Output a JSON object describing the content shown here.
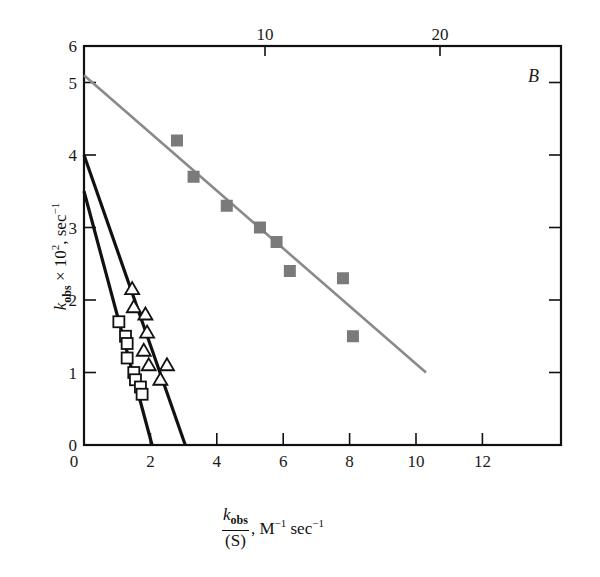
{
  "chart_data": {
    "type": "scatter",
    "title": "",
    "panel_label": "B",
    "xlabel": "k_obs/(S), M^-1 sec^-1",
    "xlabel_parts": {
      "num": "k",
      "num_sub": "obs",
      "den": "(S)",
      "rest": ", M",
      "rest_sup1": "−1",
      "rest2": " sec",
      "rest_sup2": "−1"
    },
    "ylabel": "k_obs × 10^2, sec^-1",
    "ylabel_parts": {
      "main": "k",
      "sub": "obs",
      "mid": " × 10",
      "sup": "2",
      "tail": ", sec",
      "sup2": "−1"
    },
    "xlim": [
      0,
      14.4
    ],
    "ylim": [
      0,
      5.5
    ],
    "x_ticks_bottom": [
      "0",
      "2",
      "4",
      "6",
      "8",
      "10",
      "12"
    ],
    "x_ticks_top": [
      "10",
      "20"
    ],
    "y_ticks": [
      "0",
      "1",
      "2",
      "3",
      "4",
      "5",
      "6"
    ],
    "grid": false,
    "legend": "none",
    "series": [
      {
        "name": "filled squares (gray)",
        "marker": "filled-square",
        "color": "#7a7a7a",
        "x": [
          2.8,
          3.3,
          4.3,
          5.3,
          5.8,
          6.2,
          7.8,
          8.1
        ],
        "y": [
          4.2,
          3.7,
          3.3,
          3.0,
          2.8,
          2.4,
          2.3,
          1.5
        ],
        "fit_line": {
          "x": [
            0,
            10.3
          ],
          "y": [
            5.1,
            1.0
          ],
          "color": "#8a8a8a"
        }
      },
      {
        "name": "open squares",
        "marker": "open-square",
        "color": "#111111",
        "x": [
          1.05,
          1.25,
          1.3,
          1.3,
          1.5,
          1.55,
          1.7,
          1.75
        ],
        "y": [
          1.7,
          1.5,
          1.4,
          1.2,
          1.0,
          0.9,
          0.8,
          0.7
        ],
        "fit_line": {
          "x": [
            0,
            2.05
          ],
          "y": [
            3.5,
            0
          ],
          "color": "#111111"
        }
      },
      {
        "name": "open triangles",
        "marker": "open-triangle",
        "color": "#111111",
        "x": [
          1.45,
          1.5,
          1.85,
          1.9,
          1.8,
          1.95,
          2.5,
          2.3
        ],
        "y": [
          2.15,
          1.9,
          1.8,
          1.55,
          1.3,
          1.1,
          1.1,
          0.9
        ],
        "fit_line": {
          "x": [
            0,
            3.05
          ],
          "y": [
            4.0,
            0
          ],
          "color": "#111111"
        }
      }
    ]
  }
}
